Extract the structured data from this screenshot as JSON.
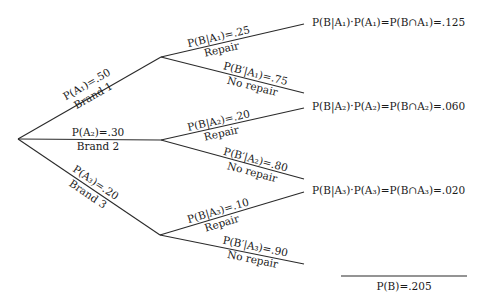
{
  "diagram": {
    "type": "probability-tree",
    "root": {
      "x": 18,
      "y": 139
    },
    "level1": [
      {
        "id": "A1",
        "name": "Brand 1",
        "prob_label": "P(A₁)=.50",
        "prob": 0.5,
        "node": {
          "x": 161,
          "y": 57
        }
      },
      {
        "id": "A2",
        "name": "Brand 2",
        "prob_label": "P(A₂)=.30",
        "prob": 0.3,
        "node": {
          "x": 161,
          "y": 140
        }
      },
      {
        "id": "A3",
        "name": "Brand 3",
        "prob_label": "P(A₃)=.20",
        "prob": 0.2,
        "node": {
          "x": 160,
          "y": 235
        }
      }
    ],
    "level2": [
      {
        "parent": "A1",
        "repair": {
          "name": "Repair",
          "prob_label": "P(B|A₁)=.25",
          "prob": 0.25,
          "end": {
            "x": 304,
            "y": 24
          }
        },
        "no_repair": {
          "name": "No repair",
          "prob_label": "P(B′|A₁)=.75",
          "prob": 0.75,
          "end": {
            "x": 304,
            "y": 93
          }
        },
        "result": "P(B|A₁)·P(A₁)=P(B∩A₁)=.125",
        "joint": 0.125
      },
      {
        "parent": "A2",
        "repair": {
          "name": "Repair",
          "prob_label": "P(B|A₂)=.20",
          "prob": 0.2,
          "end": {
            "x": 304,
            "y": 108
          }
        },
        "no_repair": {
          "name": "No repair",
          "prob_label": "P(B′|A₂)=.80",
          "prob": 0.8,
          "end": {
            "x": 304,
            "y": 179
          }
        },
        "result": "P(B|A₂)·P(A₂)=P(B∩A₂)=.060",
        "joint": 0.06
      },
      {
        "parent": "A3",
        "repair": {
          "name": "Repair",
          "prob_label": "P(B|A₃)=.10",
          "prob": 0.1,
          "end": {
            "x": 304,
            "y": 192
          }
        },
        "no_repair": {
          "name": "No repair",
          "prob_label": "P(B′|A₃)=.90",
          "prob": 0.9,
          "end": {
            "x": 304,
            "y": 264
          }
        },
        "result": "P(B|A₃)·P(A₃)=P(B∩A₃)=.020",
        "joint": 0.02
      }
    ],
    "total": {
      "label": "P(B)=.205",
      "value": 0.205
    }
  }
}
